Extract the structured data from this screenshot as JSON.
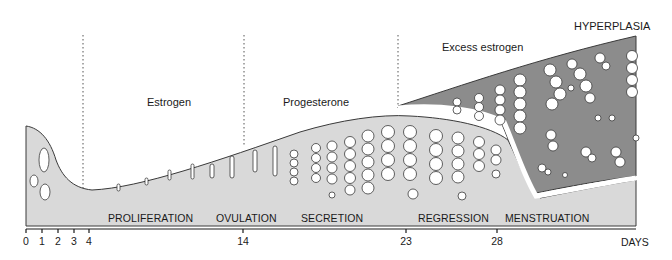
{
  "diagram": {
    "hormone_labels": {
      "estrogen": "Estrogen",
      "progesterone": "Progesterone",
      "excess_estrogen": "Excess estrogen",
      "hyperplasia": "HYPERPLASIA"
    },
    "phases": [
      {
        "key": "proliferation",
        "label": "PROLIFERATION"
      },
      {
        "key": "ovulation",
        "label": "OVULATION"
      },
      {
        "key": "secretion",
        "label": "SECRETION"
      },
      {
        "key": "regression",
        "label": "REGRESSION"
      },
      {
        "key": "menstruation",
        "label": "MENSTRUATION"
      }
    ],
    "axis": {
      "ticks": [
        "0",
        "1",
        "2",
        "3",
        "4",
        "14",
        "23",
        "28"
      ],
      "unit_label": "DAYS"
    },
    "colors": {
      "normal_endometrium": "#d9d9d9",
      "hyperplastic_endometrium": "#8c8c8c",
      "glands": "#ffffff",
      "outline": "#3a3a3a"
    }
  }
}
